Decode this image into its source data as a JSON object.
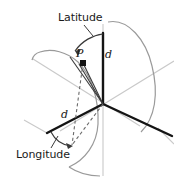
{
  "figure": {
    "colors": {
      "axis_dark": "#1a1a1a",
      "axis_light": "#c9c9c9",
      "curve_gray": "#9a9a9a",
      "text": "#1a1a1a",
      "background": "#ffffff"
    },
    "labels": {
      "latitude": "Latitude",
      "longitude": "Longitude",
      "point": "P",
      "distance_upper": "d",
      "distance_lower": "d"
    },
    "geometry": {
      "origin": {
        "x": 103,
        "y": 104
      },
      "pole_top": {
        "x": 103,
        "y": 33
      },
      "point_p": {
        "x": 83,
        "y": 63
      },
      "equator_marker": {
        "x": 72,
        "y": 145
      },
      "axis_left_end": {
        "x": 47,
        "y": 133
      },
      "axis_right_end": {
        "x": 172,
        "y": 136
      }
    }
  }
}
